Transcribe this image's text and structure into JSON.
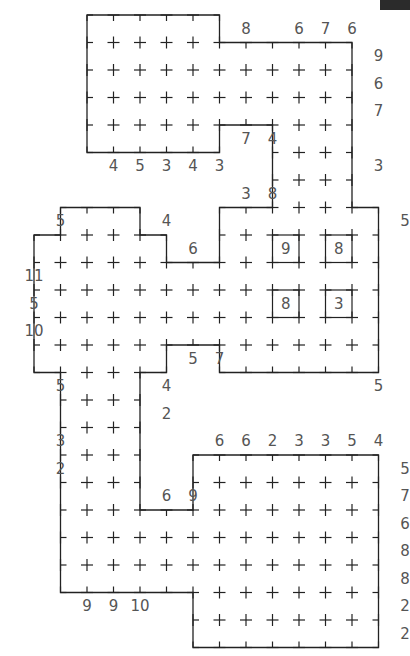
{
  "puzzle": {
    "type": "grid-logic-puzzle",
    "grid": {
      "x0": 34,
      "y0": 15,
      "cell_w": 26.5,
      "cell_h": 27.5
    },
    "colors": {
      "line": "#222222",
      "clue": "#555555",
      "background": "#ffffff",
      "badge": "#2b2b2b"
    },
    "outline": [
      [
        2,
        0
      ],
      [
        7,
        0
      ],
      [
        7,
        1
      ],
      [
        12,
        1
      ],
      [
        12,
        7
      ],
      [
        13,
        7
      ],
      [
        13,
        13
      ],
      [
        7,
        13
      ],
      [
        7,
        12
      ],
      [
        5,
        12
      ],
      [
        5,
        13
      ],
      [
        4,
        13
      ],
      [
        4,
        18
      ],
      [
        6,
        18
      ],
      [
        6,
        16
      ],
      [
        13,
        16
      ],
      [
        13,
        23
      ],
      [
        6,
        23
      ],
      [
        6,
        21
      ],
      [
        1,
        21
      ],
      [
        1,
        13
      ],
      [
        0,
        13
      ],
      [
        0,
        8
      ],
      [
        1,
        8
      ],
      [
        1,
        7
      ],
      [
        4,
        7
      ],
      [
        4,
        8
      ],
      [
        5,
        8
      ],
      [
        5,
        9
      ],
      [
        7,
        9
      ],
      [
        7,
        7
      ],
      [
        9,
        7
      ],
      [
        9,
        4
      ],
      [
        7,
        4
      ],
      [
        7,
        5
      ],
      [
        2,
        5
      ]
    ],
    "boxes": [
      {
        "c": 9,
        "r": 8,
        "label": "9"
      },
      {
        "c": 11,
        "r": 8,
        "label": "8"
      },
      {
        "c": 9,
        "r": 10,
        "label": "8"
      },
      {
        "c": 11,
        "r": 10,
        "label": "3"
      }
    ],
    "clues": [
      {
        "c": 7.5,
        "r": 0.5,
        "label": "8"
      },
      {
        "c": 9.5,
        "r": 0.5,
        "label": "6"
      },
      {
        "c": 10.5,
        "r": 0.5,
        "label": "7"
      },
      {
        "c": 11.5,
        "r": 0.5,
        "label": "6"
      },
      {
        "c": 12.5,
        "r": 1.5,
        "label": "9"
      },
      {
        "c": 12.5,
        "r": 2.5,
        "label": "6"
      },
      {
        "c": 12.5,
        "r": 3.5,
        "label": "7"
      },
      {
        "c": 12.5,
        "r": 5.5,
        "label": "3"
      },
      {
        "c": 2.5,
        "r": 5.5,
        "label": "4"
      },
      {
        "c": 3.5,
        "r": 5.5,
        "label": "5"
      },
      {
        "c": 4.5,
        "r": 5.5,
        "label": "3"
      },
      {
        "c": 5.5,
        "r": 5.5,
        "label": "4"
      },
      {
        "c": 6.5,
        "r": 5.5,
        "label": "3"
      },
      {
        "c": 7.5,
        "r": 4.5,
        "label": "7"
      },
      {
        "c": 8.5,
        "r": 4.5,
        "label": "4"
      },
      {
        "c": 7.5,
        "r": 6.5,
        "label": "3"
      },
      {
        "c": 8.5,
        "r": 6.5,
        "label": "8"
      },
      {
        "c": 0.5,
        "r": 7.5,
        "label": "5"
      },
      {
        "c": 4.5,
        "r": 7.5,
        "label": "4"
      },
      {
        "c": 5.5,
        "r": 8.5,
        "label": "6"
      },
      {
        "c": 13.5,
        "r": 7.5,
        "label": "5"
      },
      {
        "c": -0.5,
        "r": 9.5,
        "label": "11"
      },
      {
        "c": -0.5,
        "r": 10.5,
        "label": "5"
      },
      {
        "c": -0.5,
        "r": 11.5,
        "label": "10"
      },
      {
        "c": 5.5,
        "r": 12.5,
        "label": "5"
      },
      {
        "c": 6.5,
        "r": 12.5,
        "label": "7"
      },
      {
        "c": 0.5,
        "r": 13.5,
        "label": "5"
      },
      {
        "c": 4.5,
        "r": 13.5,
        "label": "4"
      },
      {
        "c": 4.5,
        "r": 14.5,
        "label": "2"
      },
      {
        "c": 12.5,
        "r": 13.5,
        "label": "5"
      },
      {
        "c": 0.5,
        "r": 15.5,
        "label": "3"
      },
      {
        "c": 0.5,
        "r": 16.5,
        "label": "2"
      },
      {
        "c": 6.5,
        "r": 15.5,
        "label": "6"
      },
      {
        "c": 7.5,
        "r": 15.5,
        "label": "6"
      },
      {
        "c": 8.5,
        "r": 15.5,
        "label": "2"
      },
      {
        "c": 9.5,
        "r": 15.5,
        "label": "3"
      },
      {
        "c": 10.5,
        "r": 15.5,
        "label": "3"
      },
      {
        "c": 11.5,
        "r": 15.5,
        "label": "5"
      },
      {
        "c": 12.5,
        "r": 15.5,
        "label": "4"
      },
      {
        "c": 13.5,
        "r": 16.5,
        "label": "5"
      },
      {
        "c": 13.5,
        "r": 17.5,
        "label": "7"
      },
      {
        "c": 13.5,
        "r": 18.5,
        "label": "6"
      },
      {
        "c": 13.5,
        "r": 19.5,
        "label": "8"
      },
      {
        "c": 13.5,
        "r": 20.5,
        "label": "8"
      },
      {
        "c": 13.5,
        "r": 21.5,
        "label": "2"
      },
      {
        "c": 13.5,
        "r": 22.5,
        "label": "2"
      },
      {
        "c": 4.5,
        "r": 17.5,
        "label": "6"
      },
      {
        "c": 5.5,
        "r": 17.5,
        "label": "9"
      },
      {
        "c": 1.5,
        "r": 21.5,
        "label": "9"
      },
      {
        "c": 2.5,
        "r": 21.5,
        "label": "9"
      },
      {
        "c": 3.5,
        "r": 21.5,
        "label": "10"
      }
    ]
  }
}
